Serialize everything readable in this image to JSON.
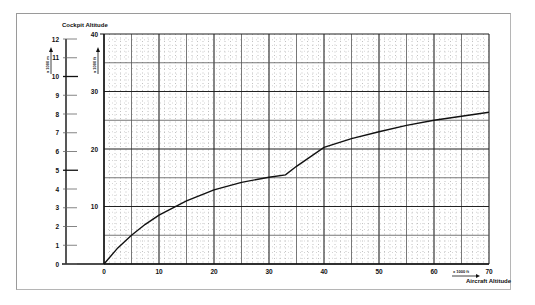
{
  "chart_data": {
    "type": "line",
    "title": "Cockpit Altitude",
    "xlabel": "Aircraft Altitude",
    "xunit": "x 1000 ft",
    "ylabel": "Cockpit Altitude",
    "yunit_ft": "x 1000 ft",
    "yunit_m": "x 1000 m",
    "xlim": [
      0,
      70
    ],
    "ylim": [
      0,
      40
    ],
    "ylim_m": [
      0,
      12
    ],
    "x_ticks": [
      0,
      10,
      20,
      30,
      40,
      50,
      60,
      70
    ],
    "x_tick_labels": [
      "0",
      "10",
      "20",
      "30",
      "40",
      "50",
      "60",
      "70"
    ],
    "y_ticks": [
      10,
      20,
      30,
      40
    ],
    "y_tick_labels": [
      "10",
      "20",
      "30",
      "40"
    ],
    "y_m_ticks": [
      0,
      1,
      2,
      3,
      4,
      5,
      6,
      7,
      8,
      9,
      10,
      11,
      12
    ],
    "y_m_tick_labels": [
      "0",
      "1",
      "2",
      "3",
      "4",
      "5",
      "6",
      "7",
      "8",
      "9",
      "10",
      "11",
      "12"
    ],
    "grid": true,
    "series": [
      {
        "name": "Cockpit altitude vs aircraft altitude",
        "x": [
          0,
          2.5,
          5,
          7.5,
          10,
          15,
          20,
          25,
          30,
          33,
          35,
          40,
          45,
          50,
          55,
          60,
          65,
          70
        ],
        "y": [
          0,
          2.8,
          5.0,
          6.9,
          8.5,
          11.0,
          12.9,
          14.2,
          15.1,
          15.5,
          17.0,
          20.3,
          21.8,
          23.0,
          24.1,
          25.0,
          25.7,
          26.4
        ]
      }
    ]
  }
}
